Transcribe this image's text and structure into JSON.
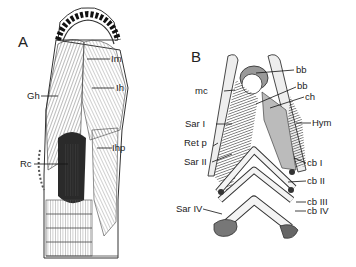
{
  "figure": {
    "panels": [
      {
        "id": "A",
        "label": "A",
        "annotations": [
          {
            "text": "Im"
          },
          {
            "text": "Ih"
          },
          {
            "text": "Gh"
          },
          {
            "text": "Rc"
          },
          {
            "text": "Ihp"
          }
        ]
      },
      {
        "id": "B",
        "label": "B",
        "annotations": [
          {
            "text": "bb"
          },
          {
            "text": "bb"
          },
          {
            "text": "mc"
          },
          {
            "text": "ch"
          },
          {
            "text": "Hym"
          },
          {
            "text": "Sar I"
          },
          {
            "text": "Ret p"
          },
          {
            "text": "Sar II"
          },
          {
            "text": "cb I"
          },
          {
            "text": "cb II"
          },
          {
            "text": "cb III"
          },
          {
            "text": "Sar IV"
          },
          {
            "text": "cb IV"
          }
        ]
      }
    ],
    "colors": {
      "ink": "#1a1a1a",
      "muscle_dark": "#3a3a3a",
      "muscle_mid": "#8a8a8a",
      "muscle_light": "#d2d2d2",
      "background": "#ffffff"
    }
  }
}
